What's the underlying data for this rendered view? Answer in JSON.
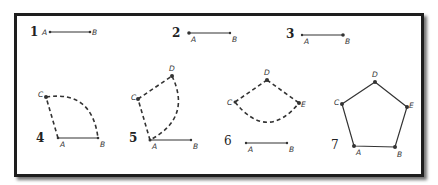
{
  "colors": {
    "ink": "#333333",
    "frame": "#1e1e1e",
    "background": "#ffffff"
  },
  "steps": [
    {
      "number": "1",
      "points": {
        "A": "A",
        "B": "B"
      },
      "description": "Segment AB"
    },
    {
      "number": "2",
      "points": {
        "A": "A",
        "B": "B"
      },
      "description": "Segment AB"
    },
    {
      "number": "3",
      "points": {
        "A": "A",
        "B": "B"
      },
      "description": "Segment AB"
    },
    {
      "number": "4",
      "points": {
        "A": "A",
        "B": "B",
        "C": "C"
      },
      "description": "Dashed segment AC and dashed arc from C to B"
    },
    {
      "number": "5",
      "points": {
        "A": "A",
        "B": "B",
        "C": "C",
        "D": "D"
      },
      "description": "Dashed segments AC, CD and dashed arc from D to A"
    },
    {
      "number": "6",
      "points": {
        "A": "A",
        "B": "B",
        "C": "C",
        "D": "D",
        "E": "E"
      },
      "description": "Dashed segments CD, DE and dashed arc from C to E; segment AB below"
    },
    {
      "number": "7",
      "points": {
        "A": "A",
        "B": "B",
        "C": "C",
        "D": "D",
        "E": "E"
      },
      "description": "Regular pentagon ABEDC"
    }
  ]
}
